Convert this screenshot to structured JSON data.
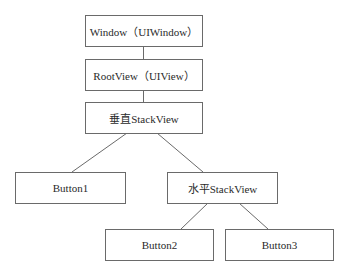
{
  "diagram": {
    "type": "tree",
    "nodes": [
      {
        "id": "window",
        "label": "Window（UIWindow）"
      },
      {
        "id": "rootview",
        "label": "RootView（UIView）"
      },
      {
        "id": "vstack",
        "label": "垂直StackView"
      },
      {
        "id": "button1",
        "label": "Button1"
      },
      {
        "id": "hstack",
        "label": "水平StackView"
      },
      {
        "id": "button2",
        "label": "Button2"
      },
      {
        "id": "button3",
        "label": "Button3"
      }
    ],
    "edges": [
      {
        "from": "window",
        "to": "rootview"
      },
      {
        "from": "rootview",
        "to": "vstack"
      },
      {
        "from": "vstack",
        "to": "button1"
      },
      {
        "from": "vstack",
        "to": "hstack"
      },
      {
        "from": "hstack",
        "to": "button2"
      },
      {
        "from": "hstack",
        "to": "button3"
      }
    ],
    "colors": {
      "stroke": "#6a6a6a",
      "text": "#2a2a2a",
      "background": "#ffffff"
    }
  }
}
